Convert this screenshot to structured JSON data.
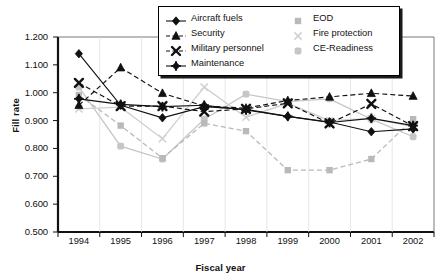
{
  "chart_data": {
    "type": "line",
    "title": "",
    "xlabel": "Fiscal year",
    "ylabel": "Fill rate",
    "categories": [
      "1994",
      "1995",
      "1996",
      "1997",
      "1998",
      "1999",
      "2000",
      "2001",
      "2002"
    ],
    "x": [
      1994,
      1995,
      1996,
      1997,
      1998,
      1999,
      2000,
      2001,
      2002
    ],
    "ylim": [
      0.5,
      1.2
    ],
    "ytick_labels": [
      "1.200",
      "1.100",
      "1.000",
      "0.900",
      "0.800",
      "0.700",
      "0.600",
      "0.500"
    ],
    "ytick_values": [
      1.2,
      1.1,
      1.0,
      0.9,
      0.8,
      0.7,
      0.6,
      0.5
    ],
    "grid": false,
    "legend_position": "top-right",
    "series": [
      {
        "name": "Aircraft fuels",
        "marker": "diamond",
        "color": "#111111",
        "style": "solid",
        "values": [
          1.14,
          0.955,
          0.91,
          0.95,
          0.94,
          0.915,
          0.895,
          0.86,
          0.87
        ]
      },
      {
        "name": "Security",
        "marker": "triangle",
        "color": "#111111",
        "style": "dashed",
        "values": [
          0.955,
          1.09,
          0.998,
          0.952,
          0.945,
          0.972,
          0.985,
          0.998,
          0.988
        ]
      },
      {
        "name": "Military personnel",
        "marker": "x-bold",
        "color": "#111111",
        "style": "dashed",
        "values": [
          1.035,
          0.952,
          0.952,
          0.932,
          0.942,
          0.962,
          0.89,
          0.96,
          0.88
        ]
      },
      {
        "name": "Maintenance",
        "marker": "plus-diamond",
        "color": "#111111",
        "style": "solid",
        "values": [
          0.978,
          0.958,
          0.95,
          0.955,
          0.938,
          0.915,
          0.893,
          0.908,
          0.882
        ]
      },
      {
        "name": "EOD",
        "marker": "square",
        "color": "#b9b9b9",
        "style": "dashed",
        "values": [
          0.992,
          0.882,
          0.765,
          0.89,
          0.862,
          0.722,
          0.722,
          0.762,
          0.905
        ]
      },
      {
        "name": "Fire protection",
        "marker": "x-light",
        "color": "#cfcfcf",
        "style": "solid",
        "values": [
          0.942,
          0.948,
          0.835,
          1.02,
          0.912,
          0.962,
          0.9,
          0.908,
          0.878
        ]
      },
      {
        "name": "CE-Readiness",
        "marker": "square-round",
        "color": "#c6c6c6",
        "style": "solid",
        "values": [
          1.02,
          0.808,
          0.762,
          0.905,
          0.995,
          0.968,
          0.978,
          0.905,
          0.842
        ]
      }
    ]
  },
  "legend": {
    "items": [
      {
        "label": "Aircraft fuels"
      },
      {
        "label": "Security"
      },
      {
        "label": "Military personnel"
      },
      {
        "label": "Maintenance"
      },
      {
        "label": "EOD"
      },
      {
        "label": "Fire protection"
      },
      {
        "label": "CE-Readiness"
      }
    ]
  }
}
